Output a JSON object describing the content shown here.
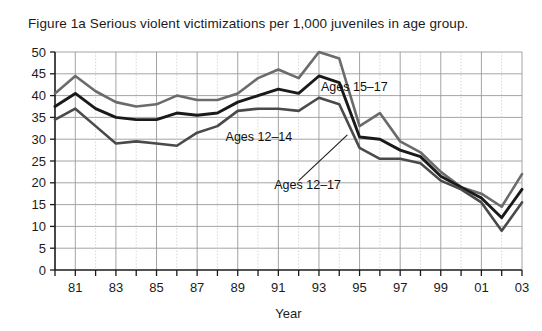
{
  "figure": {
    "title": "Figure 1a Serious violent victimizations per 1,000 juveniles in age group.",
    "year_axis_title": "Year"
  },
  "chart_data": {
    "type": "line",
    "title": "Figure 1a Serious violent victimizations per 1,000 juveniles in age group.",
    "xlabel": "Year",
    "ylabel": "",
    "xlim": [
      1980,
      2003
    ],
    "ylim": [
      0,
      50
    ],
    "ytick_step": 5,
    "yticks": [
      0,
      5,
      10,
      15,
      20,
      25,
      30,
      35,
      40,
      45,
      50
    ],
    "x": [
      1980,
      1981,
      1982,
      1983,
      1984,
      1985,
      1986,
      1987,
      1988,
      1989,
      1990,
      1991,
      1992,
      1993,
      1994,
      1995,
      1996,
      1997,
      1998,
      1999,
      2000,
      2001,
      2002,
      2003
    ],
    "xtick_labels": [
      "",
      "81",
      "",
      "83",
      "",
      "85",
      "",
      "87",
      "",
      "89",
      "",
      "91",
      "",
      "93",
      "",
      "95",
      "",
      "97",
      "",
      "99",
      "",
      "01",
      "",
      "03"
    ],
    "grid": true,
    "grid_major_every": 2,
    "legend_position": "inline-annotations",
    "series": [
      {
        "name": "Ages 15-17",
        "label": "Ages 15–17",
        "color": "#6b6b6b",
        "width": 2.6,
        "values": [
          40.5,
          44.5,
          41.0,
          38.5,
          37.5,
          38.0,
          40.0,
          39.0,
          39.0,
          40.5,
          44.0,
          46.0,
          44.0,
          50.0,
          48.5,
          33.0,
          36.0,
          29.5,
          27.0,
          22.5,
          19.0,
          17.5,
          14.5,
          22.0
        ]
      },
      {
        "name": "Ages 12-17",
        "label": "Ages 12–17",
        "color": "#1a1a1a",
        "width": 2.9,
        "values": [
          37.5,
          40.5,
          37.0,
          35.0,
          34.5,
          34.5,
          36.0,
          35.5,
          36.0,
          38.5,
          40.0,
          41.5,
          40.5,
          44.5,
          43.0,
          30.5,
          30.0,
          27.5,
          26.0,
          21.5,
          19.0,
          16.5,
          12.0,
          18.5
        ]
      },
      {
        "name": "Ages 12-14",
        "label": "Ages 12–14",
        "color": "#4a4a4a",
        "width": 2.6,
        "values": [
          34.5,
          37.0,
          33.0,
          29.0,
          29.5,
          29.0,
          28.5,
          31.5,
          33.0,
          36.5,
          37.0,
          37.0,
          36.5,
          39.5,
          38.0,
          28.0,
          25.5,
          25.5,
          24.5,
          20.5,
          18.5,
          15.5,
          9.0,
          15.5
        ]
      }
    ],
    "annotations": [
      {
        "text": "Ages 15–17",
        "x": 1993.1,
        "y": 41.0
      },
      {
        "text": "Ages 12–14",
        "x": 1988.4,
        "y": 29.5
      },
      {
        "text": "Ages 12–17",
        "x": 1990.8,
        "y": 18.5
      }
    ]
  }
}
